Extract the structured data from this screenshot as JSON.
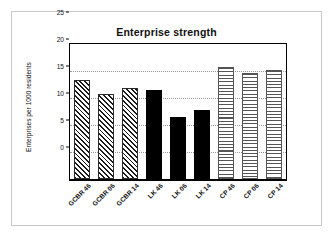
{
  "chart_data": {
    "type": "bar",
    "title": "Enterprise strength",
    "xlabel": "",
    "ylabel": "Enterprises per 1000 residents",
    "ylim": [
      0,
      25
    ],
    "ytick_values": [
      0,
      5,
      10,
      15,
      20,
      25
    ],
    "ytick_labels": [
      "0",
      "5",
      "10",
      "15",
      "20",
      "25"
    ],
    "grid": true,
    "grid_style": "dotted horizontal",
    "legend": "none",
    "categories": [
      "GCBR 46",
      "GCBR 06",
      "GCBR 14",
      "LK 46",
      "LK 06",
      "LK 14",
      "CP 46",
      "CP 06",
      "CP 14"
    ],
    "values": [
      18.3,
      15.8,
      16.8,
      16.4,
      11.5,
      12.8,
      20.7,
      19.7,
      20.2
    ],
    "bar_patterns": [
      "diagonal-hatch",
      "diagonal-hatch",
      "diagonal-hatch",
      "solid-black",
      "solid-black",
      "solid-black",
      "horizontal-hatch",
      "horizontal-hatch",
      "horizontal-hatch"
    ],
    "groups": [
      {
        "name": "GCBR",
        "pattern": "diagonal-hatch"
      },
      {
        "name": "LK",
        "pattern": "solid-black"
      },
      {
        "name": "CP",
        "pattern": "horizontal-hatch"
      }
    ],
    "colors": {
      "axis": "#000000",
      "grid": "#9a9a9a",
      "solid_bar": "#000000",
      "hatch_line": "#1a1a1a",
      "horiz_hatch_line": "#555555",
      "background": "#ffffff",
      "figure_border": "#c9c9c9"
    }
  }
}
